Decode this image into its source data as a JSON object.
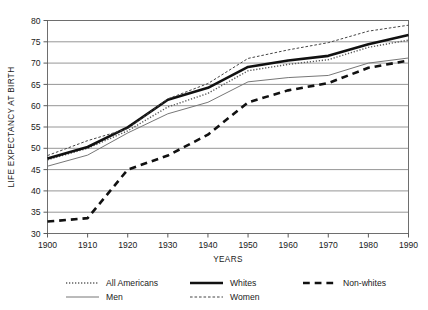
{
  "chart_data": {
    "type": "line",
    "title": "",
    "xlabel": "YEARS",
    "ylabel": "LIFE EXPECTANCY AT BIRTH",
    "x": [
      1900,
      1910,
      1920,
      1930,
      1940,
      1950,
      1960,
      1970,
      1980,
      1990
    ],
    "xlim": [
      1900,
      1990
    ],
    "ylim": [
      30,
      80
    ],
    "ytick_labels": [
      "30",
      "35",
      "40",
      "45",
      "50",
      "55",
      "60",
      "65",
      "70",
      "75",
      "80"
    ],
    "yticks": [
      30,
      35,
      40,
      45,
      50,
      55,
      60,
      65,
      70,
      75,
      80
    ],
    "xtick_labels": [
      "1900",
      "1910",
      "1920",
      "1930",
      "1940",
      "1950",
      "1960",
      "1970",
      "1980",
      "1990"
    ],
    "grid": "horizontal",
    "legend_position": "below",
    "series": [
      {
        "name": "All Americans",
        "style": "dotted",
        "width": 1.4,
        "color": "#5a5a5a",
        "values": [
          47.3,
          50.0,
          54.1,
          59.7,
          62.9,
          68.2,
          69.7,
          70.8,
          73.7,
          75.4
        ]
      },
      {
        "name": "Whites",
        "style": "solid",
        "width": 2.6,
        "color": "#111111",
        "values": [
          47.6,
          50.3,
          54.9,
          61.4,
          64.2,
          69.1,
          70.6,
          71.7,
          74.4,
          76.6
        ]
      },
      {
        "name": "Non-whites",
        "style": "dashed",
        "width": 2.6,
        "color": "#111111",
        "values": [
          32.8,
          33.6,
          45.0,
          48.3,
          53.2,
          60.8,
          63.6,
          65.3,
          68.9,
          70.6
        ]
      },
      {
        "name": "Men",
        "style": "solid",
        "width": 1.0,
        "color": "#777777",
        "values": [
          45.8,
          48.4,
          53.6,
          58.1,
          60.8,
          65.6,
          66.6,
          67.1,
          70.0,
          71.2
        ]
      },
      {
        "name": "Women",
        "style": "dashed",
        "width": 1.0,
        "color": "#444444",
        "values": [
          48.3,
          51.8,
          54.6,
          61.6,
          65.2,
          71.1,
          73.1,
          74.8,
          77.5,
          78.9
        ]
      }
    ]
  },
  "legend": {
    "items": [
      {
        "label": "All Americans",
        "key": "all-americans"
      },
      {
        "label": "Whites",
        "key": "whites"
      },
      {
        "label": "Non-whites",
        "key": "non-whites"
      },
      {
        "label": "Men",
        "key": "men"
      },
      {
        "label": "Women",
        "key": "women"
      }
    ]
  }
}
